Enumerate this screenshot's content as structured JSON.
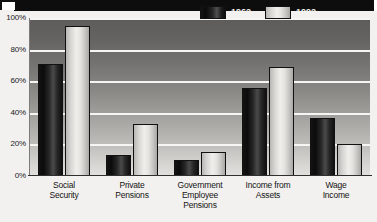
{
  "figure": {
    "title_band": "",
    "background_color": "#f2f1ef",
    "plot_gradient_top": "#5e5c5a",
    "plot_gradient_bottom": "#e3e1de",
    "gridline_color": "#f6f5f3"
  },
  "legend": {
    "position": "top-right-inside",
    "items": [
      {
        "label": "1962",
        "swatch": "dark-gradient-swatch",
        "color": "#141414"
      },
      {
        "label": "1992",
        "swatch": "light-gradient-swatch",
        "color": "#e6e4e1"
      }
    ]
  },
  "chart_data": {
    "type": "bar",
    "title": "",
    "xlabel": "",
    "ylabel": "",
    "ylim": [
      0,
      100
    ],
    "yticks": [
      "0%",
      "20%",
      "40%",
      "60%",
      "80%",
      "100%"
    ],
    "ytick_values": [
      0,
      20,
      40,
      60,
      80,
      100
    ],
    "grid": true,
    "categories": [
      "Social\nSecurity",
      "Private\nPensions",
      "Government\nEmployee\nPensions",
      "Income from\nAssets",
      "Wage\nIncome"
    ],
    "category_lines": [
      [
        "Social",
        "Security"
      ],
      [
        "Private",
        "Pensions"
      ],
      [
        "Government",
        "Employee",
        "Pensions"
      ],
      [
        "Income from",
        "Assets"
      ],
      [
        "Wage",
        "Income"
      ]
    ],
    "series": [
      {
        "name": "1962",
        "values": [
          71,
          13,
          10,
          56,
          37
        ]
      },
      {
        "name": "1992",
        "values": [
          95,
          33,
          15,
          69,
          20
        ]
      }
    ]
  }
}
